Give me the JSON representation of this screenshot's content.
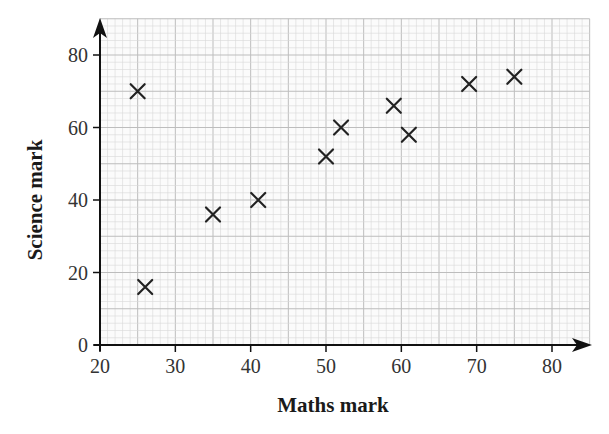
{
  "chart_data": {
    "type": "scatter",
    "title": "",
    "xlabel": "Maths mark",
    "ylabel": "Science mark",
    "xlim": [
      20,
      85
    ],
    "ylim": [
      0,
      90
    ],
    "x_ticks": [
      20,
      30,
      40,
      50,
      60,
      70,
      80
    ],
    "y_ticks": [
      0,
      20,
      40,
      60,
      80
    ],
    "grid": true,
    "legend": null,
    "marker": "x",
    "series": [
      {
        "name": "students",
        "points": [
          {
            "x": 25,
            "y": 70
          },
          {
            "x": 26,
            "y": 16
          },
          {
            "x": 35,
            "y": 36
          },
          {
            "x": 41,
            "y": 40
          },
          {
            "x": 50,
            "y": 52
          },
          {
            "x": 52,
            "y": 60
          },
          {
            "x": 59,
            "y": 66
          },
          {
            "x": 61,
            "y": 58
          },
          {
            "x": 69,
            "y": 72
          },
          {
            "x": 75,
            "y": 74
          }
        ]
      }
    ]
  },
  "style": {
    "grid_minor_color": "#d9d9d9",
    "grid_major_color": "#bdbdbd",
    "axis_color": "#111111",
    "marker_color": "#222222"
  }
}
